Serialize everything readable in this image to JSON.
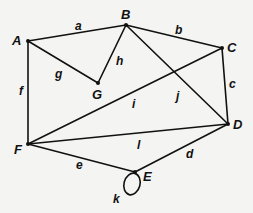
{
  "diagram": {
    "type": "graph",
    "vertices": [
      {
        "id": "A",
        "label": "A",
        "x": 28,
        "y": 41,
        "lx": 12,
        "ly": 45
      },
      {
        "id": "B",
        "label": "B",
        "x": 126,
        "y": 25,
        "lx": 121,
        "ly": 19
      },
      {
        "id": "C",
        "label": "C",
        "x": 222,
        "y": 48,
        "lx": 227,
        "ly": 52
      },
      {
        "id": "D",
        "label": "D",
        "x": 228,
        "y": 124,
        "lx": 233,
        "ly": 129
      },
      {
        "id": "E",
        "label": "E",
        "x": 135,
        "y": 172,
        "lx": 143,
        "ly": 181
      },
      {
        "id": "F",
        "label": "F",
        "x": 28,
        "y": 144,
        "lx": 14,
        "ly": 154
      },
      {
        "id": "G",
        "label": "G",
        "x": 98,
        "y": 83,
        "lx": 92,
        "ly": 99
      }
    ],
    "edges": [
      {
        "id": "a",
        "label": "a",
        "from": "A",
        "to": "B",
        "lx": 75,
        "ly": 30
      },
      {
        "id": "b",
        "label": "b",
        "from": "B",
        "to": "C",
        "lx": 175,
        "ly": 34
      },
      {
        "id": "c",
        "label": "c",
        "from": "C",
        "to": "D",
        "lx": 229,
        "ly": 88
      },
      {
        "id": "d",
        "label": "d",
        "from": "D",
        "to": "E",
        "lx": 186,
        "ly": 158
      },
      {
        "id": "e",
        "label": "e",
        "from": "F",
        "to": "E",
        "lx": 76,
        "ly": 169
      },
      {
        "id": "f",
        "label": "f",
        "from": "A",
        "to": "F",
        "lx": 19,
        "ly": 95
      },
      {
        "id": "g",
        "label": "g",
        "from": "A",
        "to": "G",
        "lx": 55,
        "ly": 78
      },
      {
        "id": "h",
        "label": "h",
        "from": "B",
        "to": "G",
        "lx": 116,
        "ly": 65
      },
      {
        "id": "i",
        "label": "i",
        "from": "F",
        "to": "C",
        "lx": 132,
        "ly": 108
      },
      {
        "id": "j",
        "label": "j",
        "from": "B",
        "to": "D",
        "lx": 176,
        "ly": 100
      },
      {
        "id": "l",
        "label": "l",
        "from": "F",
        "to": "D",
        "lx": 137,
        "ly": 149
      },
      {
        "id": "k",
        "label": "k",
        "from": "E",
        "to": "E",
        "loop": true,
        "cx": 132,
        "cy": 184,
        "rx": 8,
        "ry": 11,
        "lx": 113,
        "ly": 203
      }
    ]
  }
}
